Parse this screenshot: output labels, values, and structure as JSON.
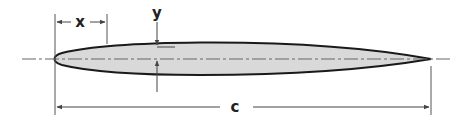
{
  "diagram": {
    "labels": {
      "x": "x",
      "y": "y",
      "chord": "c"
    },
    "colors": {
      "airfoil_fill": "#d9d9d9",
      "airfoil_outline": "#1a1a1a",
      "dimension_lines": "#555555",
      "centerline": "#666666"
    },
    "geometry": {
      "leading_edge": [
        55,
        59
      ],
      "trailing_edge": [
        431,
        59
      ],
      "max_thickness_x": 200,
      "chord_dimension_y": 107,
      "x_dimension_y": 22
    }
  }
}
